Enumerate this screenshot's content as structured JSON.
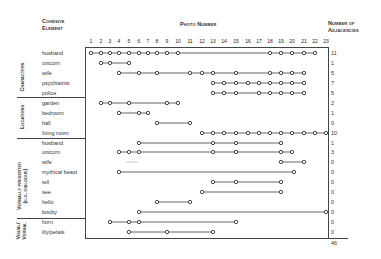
{
  "headers": {
    "element_l1": "Cohesive",
    "element_l2": "Element",
    "photo": "Photo Number",
    "adj_l1": "Number of",
    "adj_l2": "Adjacencies"
  },
  "photo_numbers": [
    "1",
    "2",
    "3",
    "4",
    "5",
    "6",
    "7",
    "8",
    "9",
    "10",
    "11",
    "12",
    "13",
    "14",
    "15",
    "16",
    "17",
    "18",
    "19",
    "20",
    "21",
    "22",
    "23"
  ],
  "groups": [
    {
      "label": "Characters"
    },
    {
      "label": "Locations"
    },
    {
      "label_l1": "Verbally presented",
      "label_l2": "(e.g. dialogue)"
    },
    {
      "label_l1": "Visual/",
      "label_l2": "Verbal"
    }
  ],
  "rows": [
    {
      "label": "husband",
      "adjacencies": "11"
    },
    {
      "label": "unicorn",
      "adjacencies": "1"
    },
    {
      "label": "wife",
      "adjacencies": "5"
    },
    {
      "label": "psychiatrist",
      "adjacencies": "7"
    },
    {
      "label": "police",
      "adjacencies": "5"
    },
    {
      "label": "garden",
      "adjacencies": "2"
    },
    {
      "label": "bedroom",
      "adjacencies": "1"
    },
    {
      "label": "hall",
      "adjacencies": "0"
    },
    {
      "label": "living room",
      "adjacencies": "10"
    },
    {
      "label": "husband",
      "adjacencies": "1"
    },
    {
      "label": "unicorn",
      "adjacencies": "3"
    },
    {
      "label": "wife",
      "adjacencies": "0"
    },
    {
      "label": "mythical beast",
      "adjacencies": "0"
    },
    {
      "label": "tell",
      "adjacencies": "0"
    },
    {
      "label": "see",
      "adjacencies": "0"
    },
    {
      "label": "hello",
      "adjacencies": "0"
    },
    {
      "label": "booby",
      "adjacencies": "0"
    },
    {
      "label": "horn",
      "adjacencies": "0"
    },
    {
      "label": "lily/petals",
      "adjacencies": "0"
    }
  ],
  "total": "46",
  "chart_data": {
    "type": "scatter",
    "xlabel": "Photo Number",
    "ylabel": "Cohesive Element",
    "x_ticks": [
      1,
      2,
      3,
      4,
      5,
      6,
      7,
      8,
      9,
      10,
      11,
      12,
      13,
      14,
      15,
      16,
      17,
      18,
      19,
      20,
      21,
      22,
      23
    ],
    "series": [
      {
        "group": "Characters",
        "name": "husband",
        "photos": [
          1,
          2,
          3,
          4,
          5,
          6,
          7,
          8,
          9,
          10,
          18,
          19,
          20,
          21,
          22
        ],
        "adjacencies": 11
      },
      {
        "group": "Characters",
        "name": "unicorn",
        "photos": [
          2,
          3,
          5
        ],
        "adjacencies": 1
      },
      {
        "group": "Characters",
        "name": "wife",
        "photos": [
          4,
          6,
          8,
          11,
          12,
          13,
          15,
          18,
          19,
          20,
          21
        ],
        "adjacencies": 5
      },
      {
        "group": "Characters",
        "name": "psychiatrist",
        "photos": [
          13,
          14,
          15,
          16,
          17,
          18,
          19,
          20,
          21
        ],
        "adjacencies": 7
      },
      {
        "group": "Characters",
        "name": "police",
        "photos": [
          13,
          14,
          15,
          17,
          18,
          19,
          20,
          21
        ],
        "adjacencies": 5
      },
      {
        "group": "Locations",
        "name": "garden",
        "photos": [
          2,
          3,
          5,
          9,
          10
        ],
        "adjacencies": 2
      },
      {
        "group": "Locations",
        "name": "bedroom",
        "photos": [
          4,
          6,
          7
        ],
        "adjacencies": 1
      },
      {
        "group": "Locations",
        "name": "hall",
        "photos": [
          8,
          11
        ],
        "adjacencies": 0
      },
      {
        "group": "Locations",
        "name": "living room",
        "photos": [
          12,
          13,
          14,
          15,
          16,
          17,
          18,
          19,
          20,
          21,
          22,
          23
        ],
        "adjacencies": 10
      },
      {
        "group": "Verbally presented (e.g. dialogue)",
        "name": "husband",
        "photos": [
          6,
          13,
          15,
          19
        ],
        "adjacencies": 1
      },
      {
        "group": "Verbally presented (e.g. dialogue)",
        "name": "unicorn",
        "photos": [
          4,
          5,
          6,
          13,
          15,
          19,
          20
        ],
        "adjacencies": 3
      },
      {
        "group": "Verbally presented (e.g. dialogue)",
        "name": "wife",
        "photos": [
          19,
          21
        ],
        "adjacencies": 0
      },
      {
        "group": "Verbally presented (e.g. dialogue)",
        "name": "mythical beast",
        "photos": [
          4,
          20
        ],
        "adjacencies": 0
      },
      {
        "group": "Verbally presented (e.g. dialogue)",
        "name": "tell",
        "photos": [
          13,
          15,
          19
        ],
        "adjacencies": 0
      },
      {
        "group": "Verbally presented (e.g. dialogue)",
        "name": "see",
        "photos": [
          12,
          19
        ],
        "adjacencies": 0
      },
      {
        "group": "Verbally presented (e.g. dialogue)",
        "name": "hello",
        "photos": [
          8,
          11
        ],
        "adjacencies": 0
      },
      {
        "group": "Verbally presented (e.g. dialogue)",
        "name": "booby",
        "photos": [
          6,
          23
        ],
        "adjacencies": 0
      },
      {
        "group": "Visual/Verbal",
        "name": "horn",
        "photos": [
          3,
          5,
          6,
          15
        ],
        "adjacencies": 0
      },
      {
        "group": "Visual/Verbal",
        "name": "lily/petals",
        "photos": [
          5,
          9,
          13
        ],
        "adjacencies": 0
      }
    ],
    "total_adjacencies": 46
  }
}
